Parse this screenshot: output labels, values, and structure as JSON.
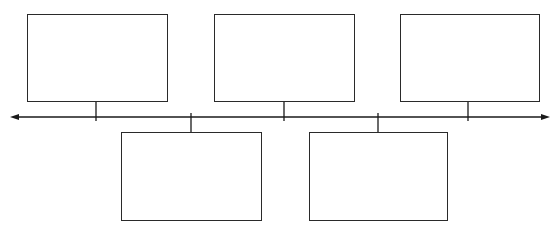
{
  "diagram": {
    "type": "timeline",
    "axis": {
      "y": 117,
      "x_start": 10,
      "x_end": 550,
      "arrows": "both",
      "color": "#1a1a1a"
    },
    "events": [
      {
        "label": "",
        "position": "above",
        "box": {
          "x": 27,
          "y": 14,
          "w": 141,
          "h": 88
        },
        "tick_x": 96
      },
      {
        "label": "",
        "position": "below",
        "box": {
          "x": 121,
          "y": 132,
          "w": 141,
          "h": 89
        },
        "tick_x": 191
      },
      {
        "label": "",
        "position": "above",
        "box": {
          "x": 214,
          "y": 14,
          "w": 141,
          "h": 88
        },
        "tick_x": 284
      },
      {
        "label": "",
        "position": "below",
        "box": {
          "x": 309,
          "y": 132,
          "w": 139,
          "h": 89
        },
        "tick_x": 378
      },
      {
        "label": "",
        "position": "above",
        "box": {
          "x": 400,
          "y": 14,
          "w": 140,
          "h": 88
        },
        "tick_x": 468
      }
    ]
  }
}
